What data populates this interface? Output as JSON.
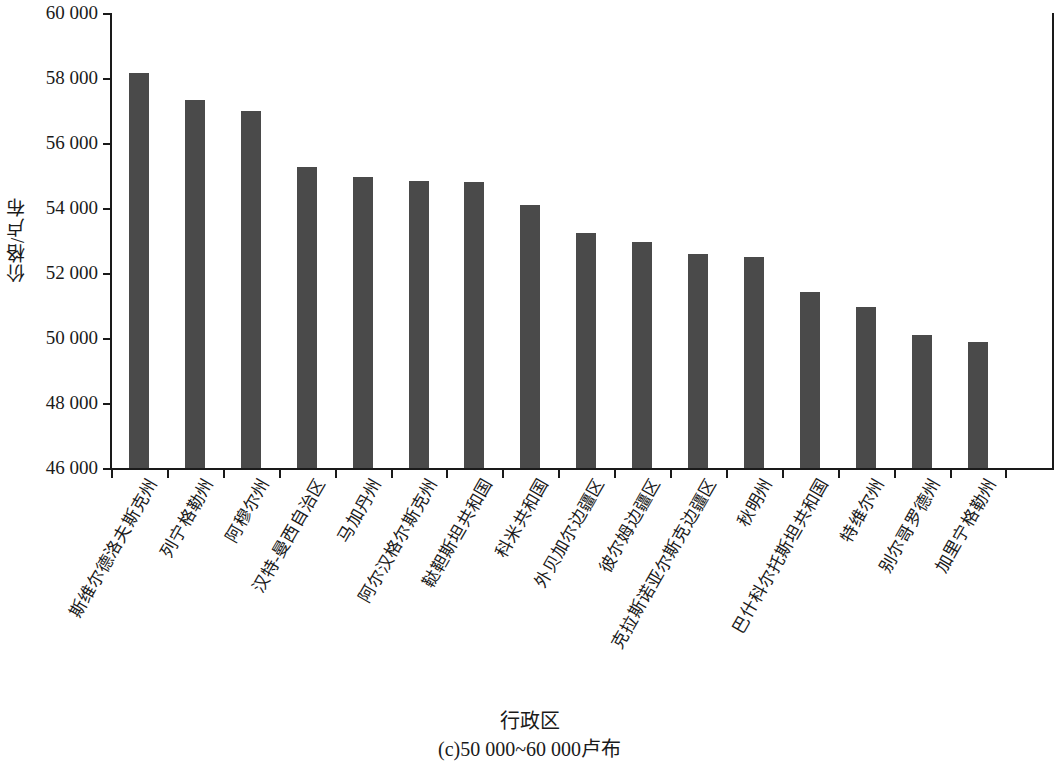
{
  "chart_data": {
    "type": "bar",
    "title": "",
    "subtitle": "",
    "caption": "(c)50 000~60 000卢布",
    "xlabel": "行政区",
    "ylabel": "价格/卢布",
    "ylim": [
      46000,
      60000
    ],
    "ytick_step": 2000,
    "ytick_labels": [
      "60 000",
      "58 000",
      "56 000",
      "54 000",
      "52 000",
      "50 000",
      "48 000",
      "46 000"
    ],
    "ytick_values": [
      60000,
      58000,
      56000,
      54000,
      52000,
      50000,
      48000,
      46000
    ],
    "grid": false,
    "legend": null,
    "bar_color": "#4a4a4a",
    "axis_color": "#1a1a1a",
    "categories": [
      "斯维尔德洛夫斯克州",
      "列宁格勒州",
      "阿穆尔州",
      "汉特-曼西自治区",
      "马加丹州",
      "阿尔汉格尔斯克州",
      "鞑靼斯坦共和国",
      "科米共和国",
      "外贝加尔边疆区",
      "彼尔姆边疆区",
      "克拉斯诺亚尔斯克边疆区",
      "秋明州",
      "巴什科尔托斯坦共和国",
      "特维尔州",
      "别尔哥罗德州",
      "加里宁格勒州"
    ],
    "values": [
      58150,
      57320,
      57000,
      55270,
      54950,
      54820,
      54790,
      54080,
      53220,
      52940,
      52600,
      52500,
      51430,
      50950,
      50080,
      49880
    ]
  }
}
